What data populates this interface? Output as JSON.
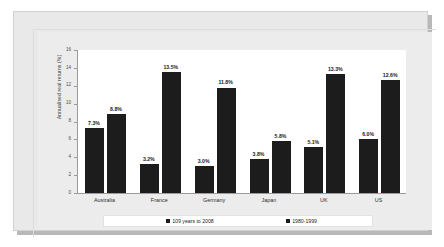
{
  "chart_data": {
    "type": "bar",
    "title": "",
    "xlabel": "",
    "ylabel": "Annualised real returns (%)",
    "ylim": [
      0,
      16
    ],
    "ytick_step": 2,
    "yticks": [
      "16",
      "14",
      "12",
      "10",
      "8",
      "6",
      "4",
      "2",
      "0"
    ],
    "grid": false,
    "legend_position": "bottom",
    "categories": [
      "Australia",
      "France",
      "Germany",
      "Japan",
      "UK",
      "US"
    ],
    "series": [
      {
        "name": "109 years to 2008",
        "color": "#1c1c1c",
        "values": [
          7.3,
          3.2,
          3.0,
          3.8,
          5.1,
          6.0
        ],
        "labels": [
          "7.3%",
          "3.2%",
          "3.0%",
          "3.8%",
          "5.1%",
          "6.0%"
        ]
      },
      {
        "name": "1980-1999",
        "color": "#1c1c1c",
        "values": [
          8.8,
          13.5,
          11.8,
          5.8,
          13.3,
          12.6
        ],
        "labels": [
          "8.8%",
          "13.5%",
          "11.8%",
          "5.8%",
          "13.3%",
          "12.6%"
        ]
      }
    ]
  },
  "colors": {
    "bar": "#1c1c1c",
    "plot_background": "#ffffff",
    "chart_background": "#ececec",
    "card_background": "#e9e9e9",
    "axis": "#9b9b9b",
    "page_background": "#ffffff"
  }
}
